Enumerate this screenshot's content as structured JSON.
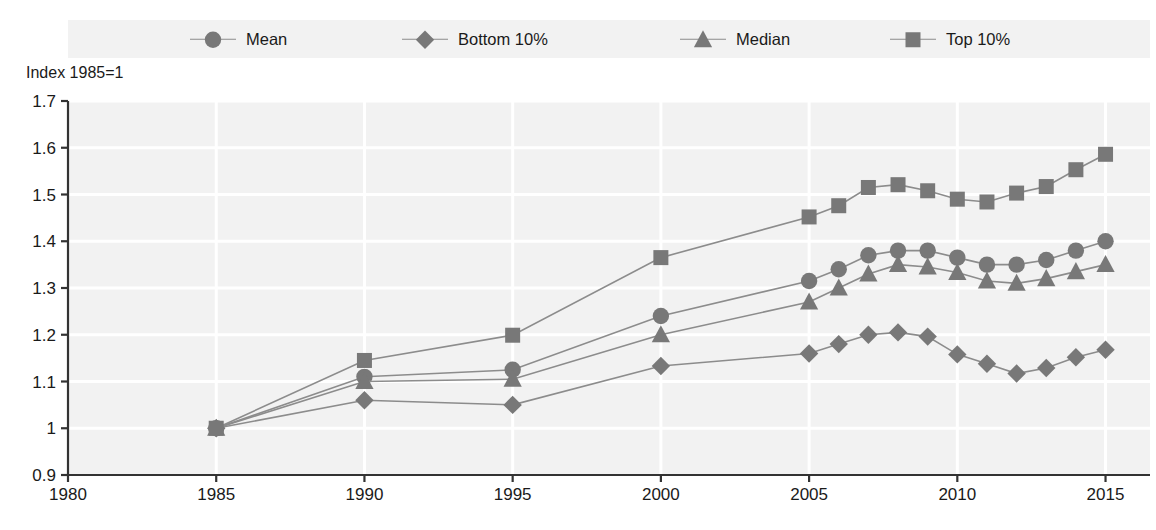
{
  "chart_data": {
    "type": "line",
    "title": "",
    "ylabel": "Index 1985=1",
    "xlabel": "",
    "ylim": [
      0.9,
      1.7
    ],
    "xlim": [
      1980,
      2016.5
    ],
    "yticks": [
      "0.9",
      "1",
      "1.1",
      "1.2",
      "1.3",
      "1.4",
      "1.5",
      "1.6",
      "1.7"
    ],
    "ytick_values": [
      0.9,
      1.0,
      1.1,
      1.2,
      1.3,
      1.4,
      1.5,
      1.6,
      1.7
    ],
    "xticks": [
      "1980",
      "1985",
      "1990",
      "1995",
      "2000",
      "2005",
      "2010",
      "2015"
    ],
    "xtick_values": [
      1980,
      1985,
      1990,
      1995,
      2000,
      2005,
      2010,
      2015
    ],
    "grid": true,
    "grid_color": "#ffffff",
    "plot_background": "#f2f2f2",
    "legend_position": "top",
    "series": [
      {
        "name": "Mean",
        "marker": "circle",
        "color": "#787878",
        "x": [
          1985,
          1990,
          1995,
          2000,
          2005,
          2006,
          2007,
          2008,
          2009,
          2010,
          2011,
          2012,
          2013,
          2014,
          2015
        ],
        "values": [
          1.0,
          1.11,
          1.125,
          1.24,
          1.315,
          1.34,
          1.37,
          1.38,
          1.38,
          1.365,
          1.35,
          1.35,
          1.36,
          1.38,
          1.4
        ]
      },
      {
        "name": "Bottom 10%",
        "marker": "diamond",
        "color": "#787878",
        "x": [
          1985,
          1990,
          1995,
          2000,
          2005,
          2006,
          2007,
          2008,
          2009,
          2010,
          2011,
          2012,
          2013,
          2014,
          2015
        ],
        "values": [
          1.0,
          1.06,
          1.05,
          1.133,
          1.16,
          1.18,
          1.2,
          1.205,
          1.196,
          1.158,
          1.138,
          1.117,
          1.129,
          1.152,
          1.168
        ]
      },
      {
        "name": "Median",
        "marker": "triangle",
        "color": "#787878",
        "x": [
          1985,
          1990,
          1995,
          2000,
          2005,
          2006,
          2007,
          2008,
          2009,
          2010,
          2011,
          2012,
          2013,
          2014,
          2015
        ],
        "values": [
          1.0,
          1.1,
          1.105,
          1.2,
          1.27,
          1.3,
          1.33,
          1.35,
          1.345,
          1.333,
          1.315,
          1.31,
          1.32,
          1.335,
          1.35
        ]
      },
      {
        "name": "Top 10%",
        "marker": "square",
        "color": "#787878",
        "x": [
          1985,
          1990,
          1995,
          2000,
          2005,
          2006,
          2007,
          2008,
          2009,
          2010,
          2011,
          2012,
          2013,
          2014,
          2015
        ],
        "values": [
          1.0,
          1.145,
          1.199,
          1.365,
          1.452,
          1.476,
          1.515,
          1.521,
          1.508,
          1.49,
          1.484,
          1.503,
          1.517,
          1.553,
          1.586
        ]
      }
    ]
  },
  "legend": {
    "items": [
      {
        "label": "Mean",
        "marker": "circle"
      },
      {
        "label": "Bottom 10%",
        "marker": "diamond"
      },
      {
        "label": "Median",
        "marker": "triangle"
      },
      {
        "label": "Top 10%",
        "marker": "square"
      }
    ]
  },
  "axes": {
    "y_axis_title": "Index 1985=1"
  }
}
